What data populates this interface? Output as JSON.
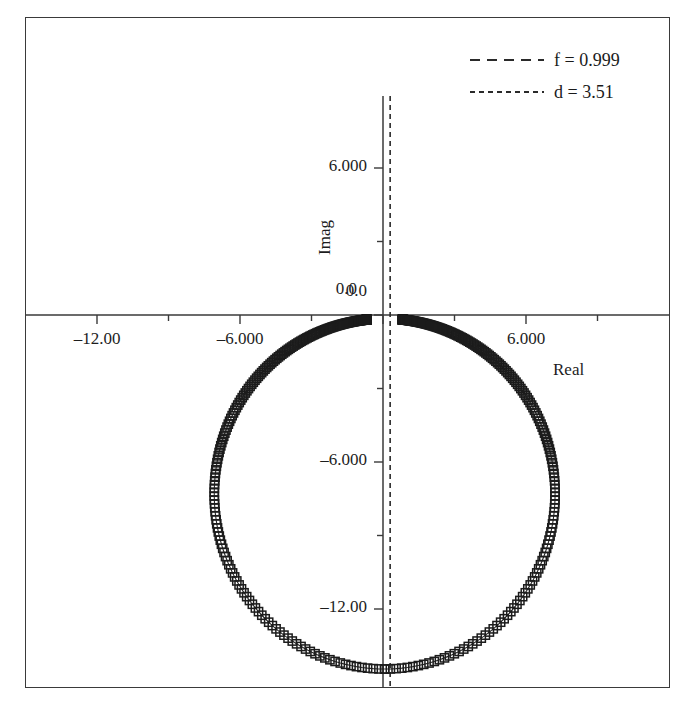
{
  "chart_data": {
    "type": "scatter",
    "title": "",
    "xlabel": "Real",
    "ylabel": "Imag",
    "xlim": [
      -15.0,
      12.0
    ],
    "ylim": [
      -15.3,
      8.9
    ],
    "grid": false,
    "marker": "open-square",
    "legend_position": "top-right",
    "x_ticks": [
      {
        "value": -12.0,
        "label": "‒12.00",
        "major": true
      },
      {
        "value": -9.0,
        "label": "",
        "major": false
      },
      {
        "value": -6.0,
        "label": "‒6.000",
        "major": true
      },
      {
        "value": -3.0,
        "label": "",
        "major": false
      },
      {
        "value": 0.0,
        "label": "0.0",
        "major": true
      },
      {
        "value": 3.0,
        "label": "",
        "major": false
      },
      {
        "value": 6.0,
        "label": "6.000",
        "major": true
      },
      {
        "value": 9.0,
        "label": "",
        "major": false
      }
    ],
    "y_ticks": [
      {
        "value": 6.0,
        "label": "6.000",
        "major": true
      },
      {
        "value": 3.0,
        "label": "",
        "major": false
      },
      {
        "value": 0.0,
        "label": "0.0",
        "major": true
      },
      {
        "value": -3.0,
        "label": "",
        "major": false
      },
      {
        "value": -6.0,
        "label": "‒6.000",
        "major": true
      },
      {
        "value": -9.0,
        "label": "",
        "major": false
      },
      {
        "value": -12.0,
        "label": "‒12.00",
        "major": true
      }
    ],
    "series": [
      {
        "name": "root-locus-circle",
        "description": "Open-square markers tracing a near-circular locus, center (0.07, -7.30), radius 7.15. Markers are extremely dense near the top of the circle (imag near 0) and sparse near the bottom, so the upper arcs render as a solid thick black band.",
        "center": [
          0.07,
          -7.3
        ],
        "radius": 7.15,
        "point_count": 220,
        "gap_at_top_degrees": 12
      }
    ],
    "reference_lines": [
      {
        "name": "vertical-dashed",
        "orientation": "vertical",
        "value": 0.3,
        "style": "dashed"
      }
    ],
    "legend": [
      {
        "label": "f = 0.999",
        "style": "dash-long"
      },
      {
        "label": "d = 3.51",
        "style": "dash-short"
      }
    ]
  },
  "axis_titles": {
    "x": "Real",
    "y": "Imag"
  },
  "tick_text": {
    "x_neg12": "‒12.00",
    "x_neg6": "‒6.000",
    "x_zero": "0.0",
    "x_pos6": "6.000",
    "y_pos6": "6.000",
    "y_zero": "0.0",
    "y_neg6": "‒6.000",
    "y_neg12": "‒12.00"
  },
  "legend": {
    "entries": [
      {
        "label": "f = 0.999"
      },
      {
        "label": "d = 3.51"
      }
    ]
  }
}
